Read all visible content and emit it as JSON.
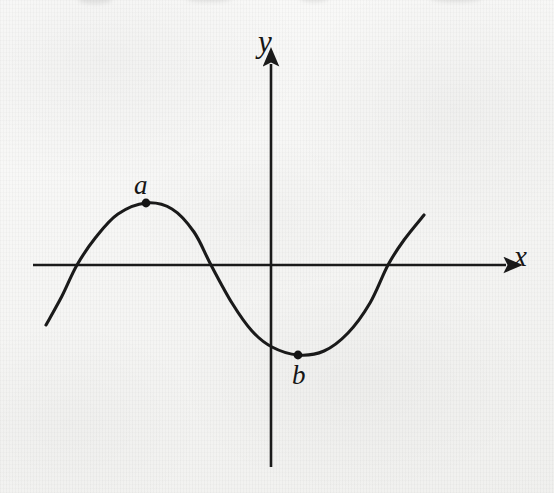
{
  "figure": {
    "kind": "cartesian-coordinate-plot",
    "background_color": "#f4f4f2",
    "ink_color": "#1a1a1a",
    "width": 554,
    "height": 493,
    "axes": {
      "x_axis": {
        "label": "x",
        "label_x": 524,
        "label_y": 256,
        "line_y": 265,
        "line_x_start": 33,
        "line_x_end": 512,
        "arrow": "right"
      },
      "y_axis": {
        "label": "y",
        "label_x": 268,
        "label_y": 42,
        "line_x": 271,
        "line_y_start": 58,
        "line_y_end": 467,
        "arrow": "up"
      },
      "origin": {
        "x": 271,
        "y": 265
      }
    },
    "points": [
      {
        "id": "a",
        "label": "a",
        "x": 146,
        "y": 203,
        "role": "local-maximum",
        "label_x": 143,
        "label_y": 186,
        "label_position": "above"
      },
      {
        "id": "b",
        "label": "b",
        "x": 298,
        "y": 355,
        "role": "local-minimum",
        "label_x": 302,
        "label_y": 377,
        "label_position": "below"
      }
    ]
  },
  "chart_data": {
    "type": "line",
    "title": "",
    "xlabel": "x",
    "ylabel": "y",
    "grid": false,
    "legend": null,
    "axis_arrows": {
      "x": "right",
      "y": "up"
    },
    "annotations": [
      {
        "text": "a",
        "point": [
          146,
          203
        ],
        "note": "local maximum of the curve, marked with a filled dot"
      },
      {
        "text": "b",
        "point": [
          298,
          355
        ],
        "note": "local minimum of the curve, marked with a filled dot"
      }
    ],
    "series": [
      {
        "name": "curve",
        "description": "smooth S-shaped (sinusoidal / cubic-like) curve rising to a local maximum at a, falling to a local minimum at b, then rising again",
        "stroke": "#1a1a1a",
        "stroke_width": 3,
        "points_px": [
          [
            46,
            325
          ],
          [
            62,
            296
          ],
          [
            77,
            265
          ],
          [
            96,
            237
          ],
          [
            118,
            214
          ],
          [
            146,
            203
          ],
          [
            172,
            209
          ],
          [
            194,
            232
          ],
          [
            211,
            265
          ],
          [
            232,
            303
          ],
          [
            252,
            331
          ],
          [
            272,
            347
          ],
          [
            298,
            355
          ],
          [
            324,
            351
          ],
          [
            348,
            333
          ],
          [
            370,
            303
          ],
          [
            388,
            265
          ],
          [
            404,
            240
          ],
          [
            424,
            215
          ]
        ],
        "x_axis_crossings_px": [
          77,
          211,
          388
        ],
        "endpoints_px": {
          "left": [
            46,
            325
          ],
          "right": [
            424,
            215
          ]
        }
      }
    ]
  }
}
